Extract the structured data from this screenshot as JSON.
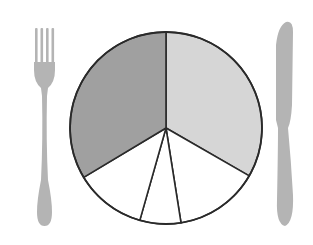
{
  "colors": {
    "background": "#ffffff",
    "utensil": "#b4b4b4",
    "outline": "#2a2a2a",
    "dark_slice": "#a0a0a0",
    "light_slice": "#d6d6d6",
    "white_slice": "#ffffff"
  },
  "chart_data": {
    "type": "pie",
    "title": "",
    "categories": [
      "Light gray portion",
      "White portion 1",
      "White portion 2",
      "White portion 3",
      "Dark gray portion"
    ],
    "values": [
      33.3,
      14.2,
      6.9,
      12.0,
      33.6
    ],
    "start_angle_deg": 0,
    "direction": "clockwise",
    "fills": [
      "#d6d6d6",
      "#ffffff",
      "#ffffff",
      "#ffffff",
      "#a0a0a0"
    ],
    "legend": "none"
  },
  "utensils": {
    "left": "fork",
    "right": "knife"
  }
}
